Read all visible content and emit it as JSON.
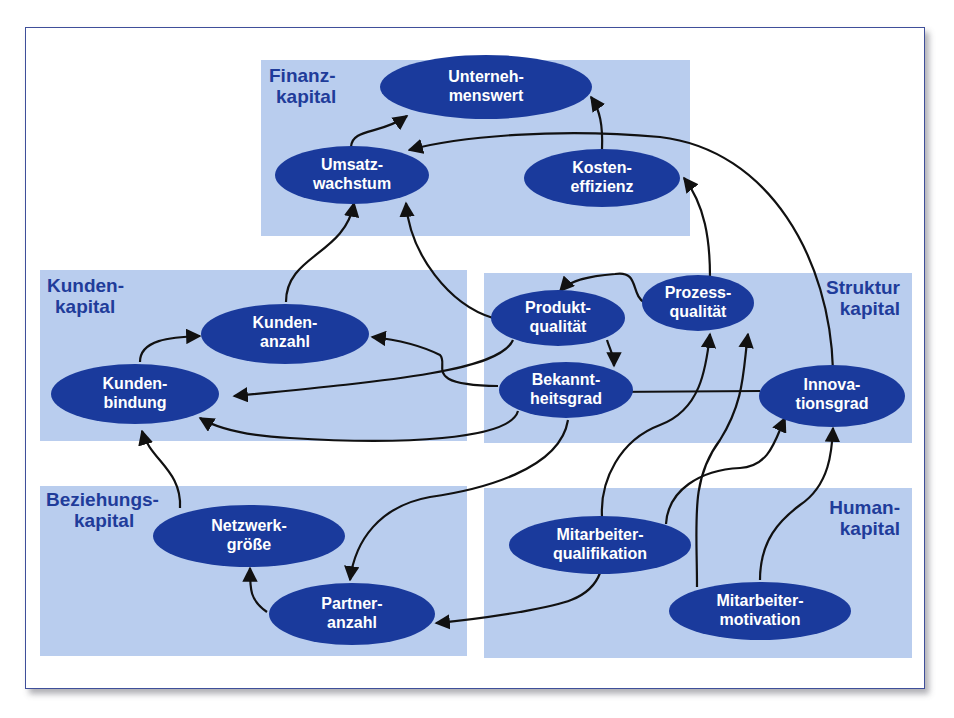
{
  "colors": {
    "panel_fill": "#b9cdee",
    "node_fill": "#1a3a9c",
    "panel_label": "#1f3c9a",
    "node_text": "#ffffff",
    "edge": "#111111",
    "frame_border": "#3f4f9a"
  },
  "panels": {
    "finanz": {
      "line1": "Finanz-",
      "line2": "kapital"
    },
    "kunden": {
      "line1": "Kunden-",
      "line2": "kapital"
    },
    "struktur": {
      "line1": "Struktur",
      "line2": "kapital"
    },
    "beziehungs": {
      "line1": "Beziehungs-",
      "line2": "kapital"
    },
    "human": {
      "line1": "Human-",
      "line2": "kapital"
    }
  },
  "nodes": {
    "unternehmenswert": {
      "line1": "Unterneh-",
      "line2": "menswert"
    },
    "umsatzwachstum": {
      "line1": "Umsatz-",
      "line2": "wachstum"
    },
    "kosteneffizienz": {
      "line1": "Kosten-",
      "line2": "effizienz"
    },
    "kundenanzahl": {
      "line1": "Kunden-",
      "line2": "anzahl"
    },
    "kundenbindung": {
      "line1": "Kunden-",
      "line2": "bindung"
    },
    "produktqualitaet": {
      "line1": "Produkt-",
      "line2": "qualität"
    },
    "prozessqualitaet": {
      "line1": "Prozess-",
      "line2": "qualität"
    },
    "bekanntheitsgrad": {
      "line1": "Bekannt-",
      "line2": "heitsgrad"
    },
    "innovationsgrad": {
      "line1": "Innova-",
      "line2": "tionsgrad"
    },
    "netzwerkgroesse": {
      "line1": "Netzwerk-",
      "line2": "größe"
    },
    "partneranzahl": {
      "line1": "Partner-",
      "line2": "anzahl"
    },
    "mitarbeiterqualifikation": {
      "line1": "Mitarbeiter-",
      "line2": "qualifikation"
    },
    "mitarbeitermotivation": {
      "line1": "Mitarbeiter-",
      "line2": "motivation"
    }
  },
  "edges": [
    {
      "from": "Umsatzwachstum",
      "to": "Unternehmenswert"
    },
    {
      "from": "Kosteneffizienz",
      "to": "Unternehmenswert"
    },
    {
      "from": "Innovationsgrad",
      "to": "Umsatzwachstum"
    },
    {
      "from": "Kundenanzahl",
      "to": "Umsatzwachstum"
    },
    {
      "from": "Produktqualität",
      "to": "Umsatzwachstum"
    },
    {
      "from": "Prozessqualität",
      "to": "Kosteneffizienz"
    },
    {
      "from": "Prozessqualität",
      "to": "Produktqualität"
    },
    {
      "from": "Kundenbindung",
      "to": "Kundenanzahl"
    },
    {
      "from": "Bekanntheitsgrad",
      "to": "Kundenanzahl"
    },
    {
      "from": "Produktqualität",
      "to": "Kundenbindung"
    },
    {
      "from": "Bekanntheitsgrad",
      "to": "Kundenbindung"
    },
    {
      "from": "Produktqualität",
      "to": "Bekanntheitsgrad"
    },
    {
      "from": "Innovationsgrad",
      "to": "Bekanntheitsgrad"
    },
    {
      "from": "Netzwerkgröße",
      "to": "Kundenbindung"
    },
    {
      "from": "Partneranzahl",
      "to": "Netzwerkgröße"
    },
    {
      "from": "Bekanntheitsgrad",
      "to": "Partneranzahl"
    },
    {
      "from": "Mitarbeiterqualifikation",
      "to": "Partneranzahl"
    },
    {
      "from": "Mitarbeiterqualifikation",
      "to": "Prozessqualität"
    },
    {
      "from": "Mitarbeiterqualifikation",
      "to": "Innovationsgrad"
    },
    {
      "from": "Mitarbeitermotivation",
      "to": "Prozessqualität"
    },
    {
      "from": "Mitarbeitermotivation",
      "to": "Innovationsgrad"
    }
  ]
}
